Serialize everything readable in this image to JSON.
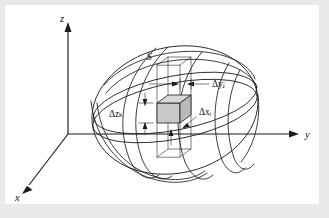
{
  "figure": {
    "kind": "3d-geometry-diagram",
    "background_color": "#e9e9e9",
    "plate_color": "#ffffff",
    "ink_color": "#1b1b1b",
    "box_fill_color": "#c9c9c9",
    "axes": {
      "z": {
        "label": "z",
        "direction": "up"
      },
      "y": {
        "label": "y",
        "direction": "right"
      },
      "x": {
        "label": "x",
        "direction": "lower-left"
      },
      "origin_label": ""
    },
    "solid": {
      "label": "S"
    },
    "dimension_labels": [
      {
        "id": "delta-y",
        "symbol": "Δ",
        "variable": "y",
        "subscript": "j",
        "text": "Δyⱼ"
      },
      {
        "id": "delta-z",
        "symbol": "Δ",
        "variable": "z",
        "subscript": "k",
        "text": "Δzₖ"
      },
      {
        "id": "delta-x",
        "symbol": "Δ",
        "variable": "x",
        "subscript": "i",
        "text": "Δxᵢ"
      }
    ]
  }
}
